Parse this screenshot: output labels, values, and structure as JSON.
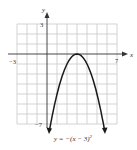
{
  "chart_data": {
    "type": "line",
    "title": "",
    "equation_label": "y = −(x − 3)²",
    "xlabel": "x",
    "ylabel": "y",
    "xlim": [
      -3,
      7
    ],
    "ylim": [
      -7,
      3
    ],
    "x_tick_labels": [
      "−3",
      "7"
    ],
    "y_tick_labels": [
      "3",
      "−7"
    ],
    "grid": true,
    "series": [
      {
        "name": "y = -(x - 3)^2",
        "x": [
          0,
          1,
          2,
          3,
          4,
          5,
          6
        ],
        "y": [
          -9,
          -4,
          -1,
          0,
          -1,
          -4,
          -9
        ],
        "vertex": [
          3,
          0
        ],
        "color": "#1a1a1a"
      }
    ]
  },
  "labels": {
    "x_axis": "x",
    "y_axis": "y",
    "x_min": "−3",
    "x_max": "7",
    "y_max": "3",
    "y_min": "−7",
    "equation_main": "y = −(x − 3)",
    "equation_exp": "2"
  },
  "colors": {
    "grid": "#c8c8c8",
    "axis": "#333333",
    "curve": "#1a1a1a"
  }
}
